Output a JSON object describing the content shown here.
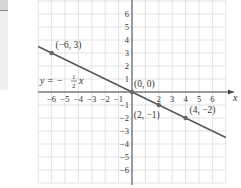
{
  "graph": {
    "equation": {
      "lhs": "y = −",
      "num": "1",
      "den": "2",
      "var": "x"
    },
    "x_axis_label": "x",
    "x_ticks": [
      {
        "v": -6,
        "label": "−6"
      },
      {
        "v": -5,
        "label": "−5"
      },
      {
        "v": -4,
        "label": "−4"
      },
      {
        "v": -3,
        "label": "−3"
      },
      {
        "v": -2,
        "label": "−2"
      },
      {
        "v": -1,
        "label": "−1"
      },
      {
        "v": 2,
        "label": "2"
      },
      {
        "v": 3,
        "label": "3"
      },
      {
        "v": 4,
        "label": "4"
      },
      {
        "v": 5,
        "label": "5"
      },
      {
        "v": 6,
        "label": "6"
      }
    ],
    "y_ticks": [
      {
        "v": 6,
        "label": "6"
      },
      {
        "v": 5,
        "label": "5"
      },
      {
        "v": 4,
        "label": "4"
      },
      {
        "v": 3,
        "label": "3"
      },
      {
        "v": 2,
        "label": "2"
      },
      {
        "v": 1,
        "label": "1"
      },
      {
        "v": -1,
        "label": "−1"
      },
      {
        "v": -2,
        "label": "−2"
      },
      {
        "v": -3,
        "label": "−3"
      },
      {
        "v": -4,
        "label": "−4"
      },
      {
        "v": -5,
        "label": "−5"
      },
      {
        "v": -6,
        "label": "−6"
      }
    ],
    "points": [
      {
        "x": -6,
        "y": 3,
        "label": "(−6, 3)"
      },
      {
        "x": 0,
        "y": 0,
        "label": "(0, 0)"
      },
      {
        "x": 2,
        "y": -1,
        "label": "(2, −1)"
      },
      {
        "x": 4,
        "y": -2,
        "label": "(4, −2)"
      }
    ],
    "colors": {
      "grid": "#dcdcdc",
      "axis": "#444444",
      "line": "#555555",
      "point": "#666666"
    }
  }
}
